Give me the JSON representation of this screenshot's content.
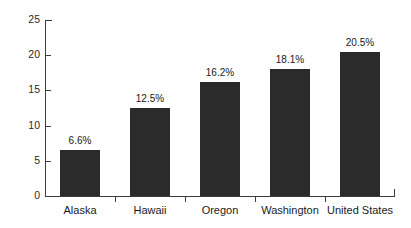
{
  "chart_data": {
    "type": "bar",
    "title": "",
    "subtitle": "",
    "xlabel": "",
    "ylabel": "",
    "categories": [
      "Alaska",
      "Hawaii",
      "Oregon",
      "Washington",
      "United States"
    ],
    "values": [
      6.6,
      12.5,
      16.2,
      18.1,
      20.5
    ],
    "data_labels": [
      "6.6%",
      "12.5%",
      "16.2%",
      "18.1%",
      "20.5%"
    ],
    "ylim": [
      0,
      25
    ],
    "y_ticks": [
      0,
      5,
      10,
      15,
      20,
      25
    ],
    "y_tick_labels": [
      "0",
      "5",
      "10",
      "15",
      "20",
      "25"
    ],
    "grid": false,
    "legend": null,
    "legend_position": "none",
    "bar_color": "#2b2b2b",
    "axis_color": "#3c3c3c",
    "background_color": "#ffffff",
    "text_color": "#1a1a1a"
  }
}
